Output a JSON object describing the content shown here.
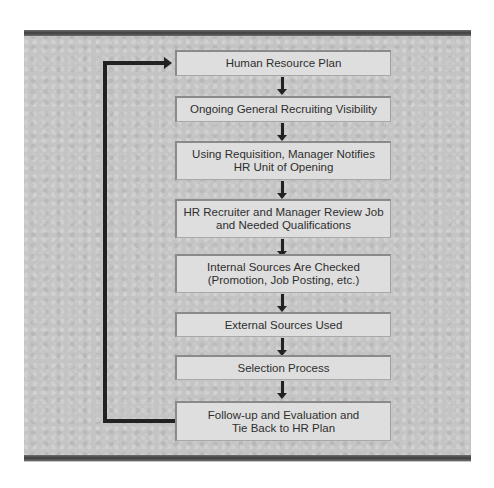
{
  "diagram": {
    "type": "flowchart",
    "steps": [
      {
        "label": "Human Resource Plan"
      },
      {
        "label": "Ongoing General Recruiting Visibility"
      },
      {
        "label": "Using Requisition, Manager Notifies\nHR Unit of Opening"
      },
      {
        "label": "HR Recruiter and Manager Review Job\nand Needed Qualifications"
      },
      {
        "label": "Internal Sources Are Checked\n(Promotion, Job Posting, etc.)"
      },
      {
        "label": "External Sources Used"
      },
      {
        "label": "Selection Process"
      },
      {
        "label": "Follow-up and Evaluation and\nTie Back to HR Plan"
      }
    ],
    "feedback_loop": {
      "from": "Follow-up and Evaluation and Tie Back to HR Plan",
      "to": "Human Resource Plan"
    }
  }
}
